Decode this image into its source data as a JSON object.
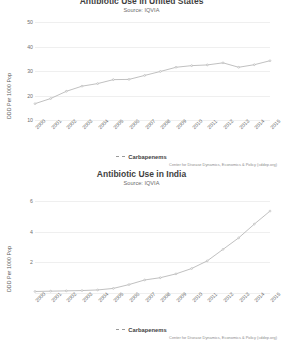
{
  "charts": [
    {
      "title": "Antibiotic Use in United States",
      "source": "Source: IQVIA",
      "ylabel": "DDD Per 1000 Pop",
      "legend_label": "Carbapenems",
      "attribution": "Center for Disease Dynamics, Economics & Policy (cddep.org)",
      "chart_data": {
        "type": "line",
        "title": "Antibiotic Use in United States",
        "subtitle": "Source: IQVIA",
        "xlabel": "",
        "ylabel": "DDD Per 1000 Pop",
        "x": [
          "2000",
          "2001",
          "2002",
          "2003",
          "2004",
          "2005",
          "2006",
          "2007",
          "2008",
          "2009",
          "2010",
          "2011",
          "2012",
          "2013",
          "2014",
          "2015"
        ],
        "xticklabels": [
          "2000",
          "2001",
          "2002",
          "2003",
          "2004",
          "2005",
          "2006",
          "2007",
          "2008",
          "2009",
          "2010",
          "2011",
          "2012",
          "2013",
          "2014",
          "2015"
        ],
        "yticklabels": [
          "10",
          "20",
          "30",
          "40",
          "50"
        ],
        "ylim": [
          10,
          52
        ],
        "yticks": [
          10,
          20,
          30,
          40,
          50
        ],
        "grid": true,
        "legend_position": "bottom-center",
        "series": [
          {
            "name": "Carbapenems",
            "color": "#b0b0b0",
            "marker": "circle",
            "values": [
              17.0,
              19.2,
              22.3,
              24.5,
              25.6,
              27.3,
              27.4,
              29.1,
              30.8,
              32.6,
              33.3,
              33.6,
              34.5,
              32.6,
              33.7,
              35.4
            ]
          }
        ]
      }
    },
    {
      "title": "Antibiotic Use in India",
      "source": "Source: IQVIA",
      "ylabel": "DDD Per 1000 Pop",
      "legend_label": "Carbapenems",
      "attribution": "Center for Disease Dynamics, Economics & Policy (cddep.org)",
      "chart_data": {
        "type": "line",
        "title": "Antibiotic Use in India",
        "subtitle": "Source: IQVIA",
        "xlabel": "",
        "ylabel": "DDD Per 1000 Pop",
        "x": [
          "2000",
          "2001",
          "2002",
          "2003",
          "2004",
          "2005",
          "2006",
          "2007",
          "2008",
          "2009",
          "2010",
          "2011",
          "2012",
          "2013",
          "2014",
          "2015"
        ],
        "xticklabels": [
          "2000",
          "2001",
          "2002",
          "2003",
          "2004",
          "2005",
          "2006",
          "2007",
          "2008",
          "2009",
          "2010",
          "2011",
          "2012",
          "2013",
          "2014",
          "2015"
        ],
        "yticklabels": [
          "2",
          "4",
          "6"
        ],
        "ylim": [
          0,
          6.4
        ],
        "yticks": [
          2,
          4,
          6
        ],
        "grid": true,
        "legend_position": "bottom-center",
        "series": [
          {
            "name": "Carbapenems",
            "color": "#b0b0b0",
            "marker": "circle",
            "values": [
              0.1,
              0.12,
              0.14,
              0.16,
              0.2,
              0.3,
              0.55,
              0.85,
              1.0,
              1.25,
              1.6,
              2.1,
              2.85,
              3.6,
              4.5,
              5.35
            ]
          }
        ]
      }
    }
  ]
}
